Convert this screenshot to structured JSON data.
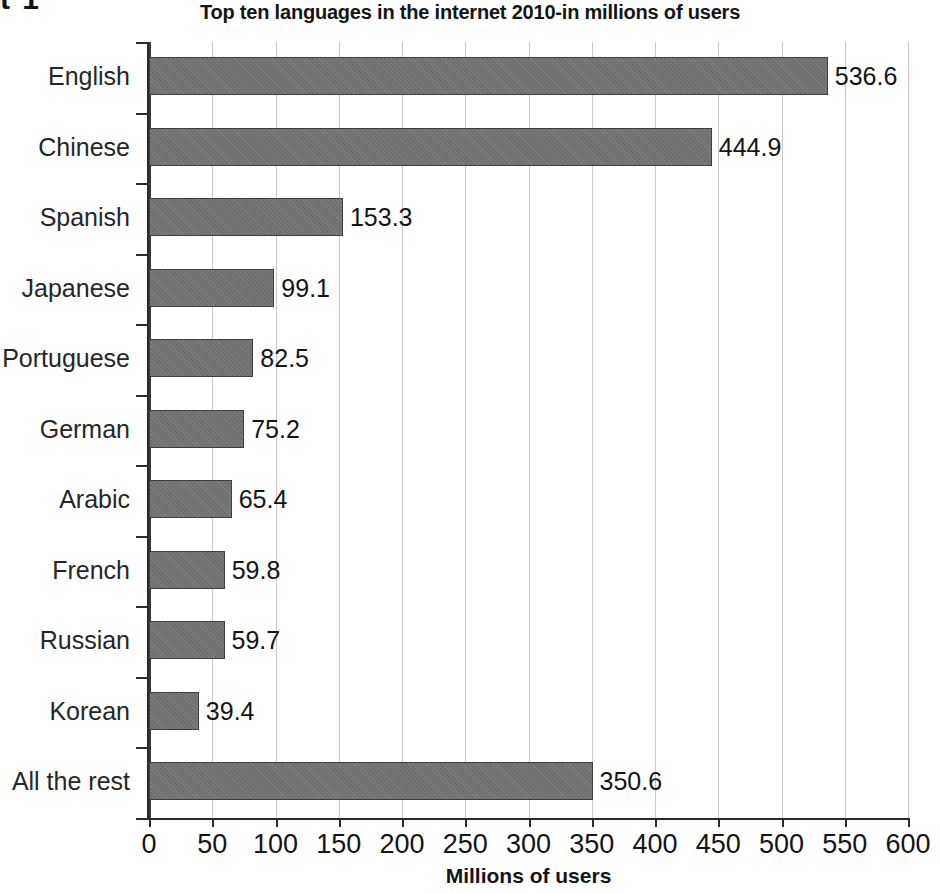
{
  "caption_fragment": "t 1",
  "chart_data": {
    "type": "bar",
    "orientation": "horizontal",
    "title": "Top ten languages in the internet 2010-in millions of users",
    "xlabel": "Millions of users",
    "ylabel": "",
    "xlim": [
      0,
      600
    ],
    "xticks": [
      0,
      50,
      100,
      150,
      200,
      250,
      300,
      350,
      400,
      450,
      500,
      550,
      600
    ],
    "xtick_labels": [
      "0",
      "50",
      "100",
      "150",
      "200",
      "250",
      "300",
      "350",
      "400",
      "450",
      "500",
      "550",
      "600"
    ],
    "grid": "vertical",
    "legend": "none",
    "categories": [
      "English",
      "Chinese",
      "Spanish",
      "Japanese",
      "Portuguese",
      "German",
      "Arabic",
      "French",
      "Russian",
      "Korean",
      "All the rest"
    ],
    "values": [
      536.6,
      444.9,
      153.3,
      99.1,
      82.5,
      75.2,
      65.4,
      59.8,
      59.7,
      39.4,
      350.6
    ],
    "value_labels": [
      "536.6",
      "444.9",
      "153.3",
      "99.1",
      "82.5",
      "75.2",
      "65.4",
      "59.8",
      "59.7",
      "39.4",
      "350.6"
    ],
    "bar_color": "#6f6f6f",
    "bar_edge_color": "#3f3f3f",
    "grid_color": "#c9c9c9",
    "axis_color": "#2b2b2b",
    "text_color": "#141414"
  }
}
